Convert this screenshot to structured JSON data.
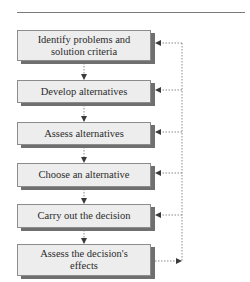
{
  "diagram": {
    "type": "flowchart",
    "steps": [
      {
        "label": "Identify problems and solution criteria"
      },
      {
        "label": "Develop alternatives"
      },
      {
        "label": "Assess alternatives"
      },
      {
        "label": "Choose an alternative"
      },
      {
        "label": "Carry out the decision"
      },
      {
        "label": "Assess the decision's effects"
      }
    ],
    "feedback_loop": {
      "from": "Assess the decision's effects",
      "to": [
        "Identify problems and solution criteria",
        "Develop alternatives",
        "Assess alternatives",
        "Choose an alternative",
        "Carry out the decision"
      ],
      "line_style": "dotted"
    },
    "colors": {
      "box_fill": "#ededed",
      "box_shadow": "#6f6f6f",
      "text": "#2b2b2b",
      "connector": "#8a8a8a",
      "arrowhead": "#3a3a3a"
    }
  }
}
